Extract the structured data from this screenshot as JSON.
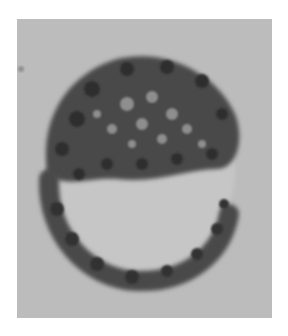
{
  "image": {
    "subject": "cell-with-dark-granules",
    "background_color": "#ffffff",
    "panel_color": "#bcbcbc",
    "granule_color": "#3a3a3a",
    "cell_interior_color": "#c4c4c4"
  }
}
